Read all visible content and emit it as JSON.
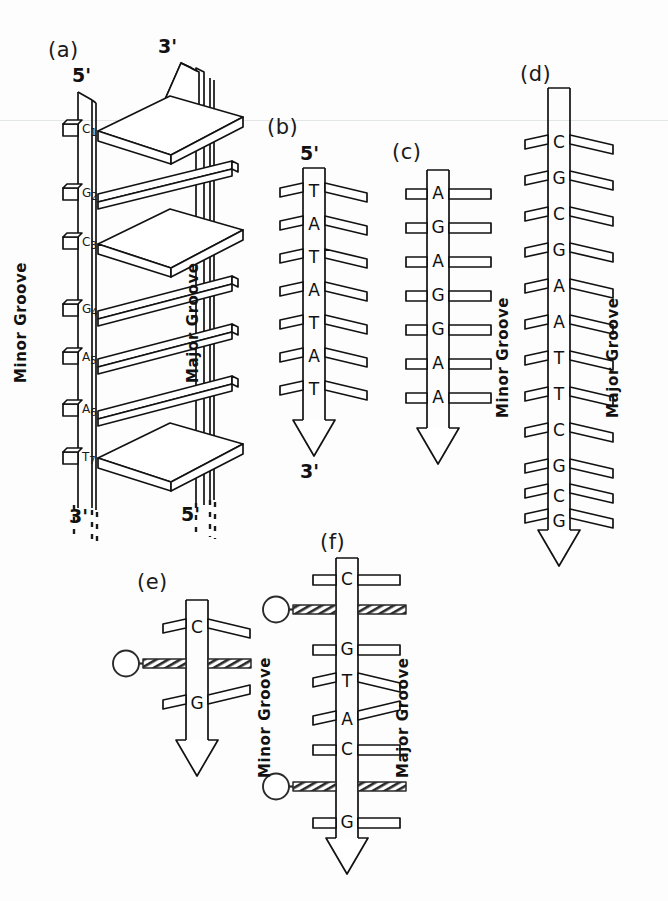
{
  "figure": {
    "background_color": "#fdfdfd",
    "ink_color": "#121212",
    "scan_artifact_line": true
  },
  "panels": {
    "a": {
      "label": "(a)",
      "top_left_end": "5'",
      "top_right_end": "3'",
      "bottom_left_end": "3'",
      "bottom_right_end": "5'",
      "minor_groove_label": "Minor  Groove",
      "major_groove_label": "Major  Groove",
      "bases": [
        {
          "letter": "C",
          "number": "1",
          "pair_style": "wide-slab"
        },
        {
          "letter": "G",
          "number": "2",
          "pair_style": "tilted-bar"
        },
        {
          "letter": "C",
          "number": "3",
          "pair_style": "wide-slab"
        },
        {
          "letter": "G",
          "number": "4",
          "pair_style": "tilted-bar"
        },
        {
          "letter": "A",
          "number": "5",
          "pair_style": "tilted-bar"
        },
        {
          "letter": "A",
          "number": "6",
          "pair_style": "tilted-bar"
        },
        {
          "letter": "T",
          "number": "7",
          "pair_style": "wide-slab"
        }
      ]
    },
    "b": {
      "label": "(b)",
      "top_end": "5'",
      "bottom_end": "3'",
      "sequence": [
        "T",
        "A",
        "T",
        "A",
        "T",
        "A",
        "T"
      ],
      "pair_style": "tilted-bar"
    },
    "c": {
      "label": "(c)",
      "sequence": [
        "A",
        "G",
        "A",
        "G",
        "G",
        "A",
        "A"
      ],
      "pair_style": "flat-bar"
    },
    "d": {
      "label": "(d)",
      "minor_groove_label": "Minor  Groove",
      "major_groove_label": "Major  Groove",
      "sequence": [
        "C",
        "G",
        "C",
        "G",
        "A",
        "A",
        "T",
        "T",
        "C",
        "G",
        "C",
        "G"
      ],
      "pair_style": "tilted-bar"
    },
    "e": {
      "label": "(e)",
      "sequence": [
        "C",
        "G"
      ],
      "intercalator_after_index": 0,
      "intercalator_count": 1,
      "pair_style": "tilted-bar"
    },
    "f": {
      "label": "(f)",
      "minor_groove_label": "Minor  Groove",
      "major_groove_label": "Major  Groove",
      "sequence": [
        "C",
        "G",
        "T",
        "A",
        "C",
        "G"
      ],
      "intercalator_after_indices": [
        0,
        4
      ],
      "intercalator_count": 2,
      "pair_styles": [
        "flat-bar",
        "flat-bar",
        "tilted-bar",
        "tilted-bar",
        "flat-bar",
        "flat-bar"
      ]
    }
  }
}
